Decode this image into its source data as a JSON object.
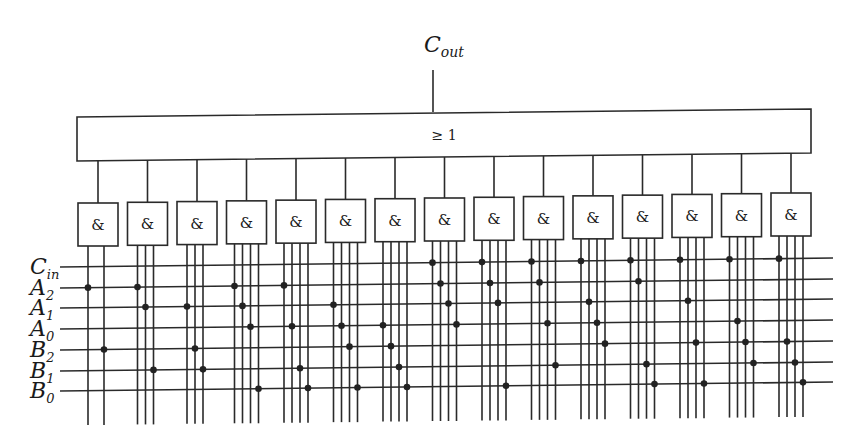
{
  "output": {
    "name": "C",
    "sub": "out"
  },
  "or_gate": {
    "label": "≥ 1"
  },
  "and_gate_label": "&",
  "inputs": [
    {
      "id": "Cin",
      "name": "C",
      "sub": "in"
    },
    {
      "id": "A2",
      "name": "A",
      "sub": "2"
    },
    {
      "id": "A1",
      "name": "A",
      "sub": "1"
    },
    {
      "id": "A0",
      "name": "A",
      "sub": "0"
    },
    {
      "id": "B2",
      "name": "B",
      "sub": "2"
    },
    {
      "id": "B1",
      "name": "B",
      "sub": "1"
    },
    {
      "id": "B0",
      "name": "B",
      "sub": "0"
    }
  ],
  "and_gates": [
    {
      "index": 1,
      "terms": [
        "A2",
        "B2"
      ]
    },
    {
      "index": 2,
      "terms": [
        "A2",
        "A1",
        "B1"
      ]
    },
    {
      "index": 3,
      "terms": [
        "A1",
        "B2",
        "B1"
      ]
    },
    {
      "index": 4,
      "terms": [
        "A2",
        "A1",
        "A0",
        "B0"
      ]
    },
    {
      "index": 5,
      "terms": [
        "A2",
        "A0",
        "B1",
        "B0"
      ]
    },
    {
      "index": 6,
      "terms": [
        "A1",
        "A0",
        "B2",
        "B0"
      ]
    },
    {
      "index": 7,
      "terms": [
        "A0",
        "B2",
        "B1",
        "B0"
      ]
    },
    {
      "index": 8,
      "terms": [
        "Cin",
        "A2",
        "A1",
        "A0"
      ]
    },
    {
      "index": 9,
      "terms": [
        "Cin",
        "A2",
        "A1",
        "B0"
      ]
    },
    {
      "index": 10,
      "terms": [
        "Cin",
        "A2",
        "A0",
        "B1"
      ]
    },
    {
      "index": 11,
      "terms": [
        "Cin",
        "A1",
        "A0",
        "B2"
      ]
    },
    {
      "index": 12,
      "terms": [
        "Cin",
        "A2",
        "B1",
        "B0"
      ]
    },
    {
      "index": 13,
      "terms": [
        "Cin",
        "A1",
        "B2",
        "B0"
      ]
    },
    {
      "index": 14,
      "terms": [
        "Cin",
        "A0",
        "B2",
        "B1"
      ]
    },
    {
      "index": 15,
      "terms": [
        "Cin",
        "B2",
        "B1",
        "B0"
      ]
    }
  ]
}
